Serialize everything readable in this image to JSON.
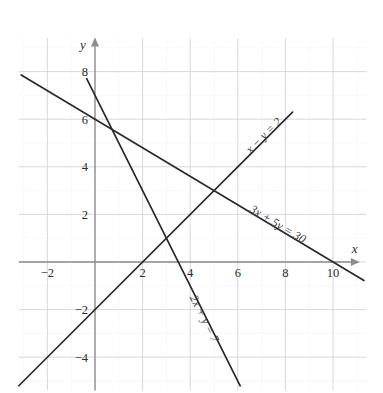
{
  "figure": {
    "type": "line-graph",
    "background": "#ffffff",
    "line_color": "#2a2a2a",
    "axis_color": "#8c8c8c",
    "grid_color_minor": "#e4e4ea",
    "grid_color_major": "#d2d2da"
  },
  "axes": {
    "x_label": "x",
    "y_label": "y",
    "x_ticks": [
      "-2",
      "2",
      "4",
      "6",
      "8",
      "10"
    ],
    "y_ticks": [
      "8",
      "6",
      "4",
      "2",
      "-2",
      "-4"
    ],
    "x_range": [
      -3.2,
      11.4
    ],
    "y_range": [
      -5.4,
      9.4
    ],
    "origin_px": [
      95,
      262
    ],
    "unit_px": 23.8,
    "grid": true,
    "arrow_x": true,
    "arrow_y": true
  },
  "chart_data": {
    "type": "line",
    "title": "",
    "xlabel": "x",
    "ylabel": "y",
    "xlim": [
      -3.2,
      11.4
    ],
    "ylim": [
      -5.4,
      9.4
    ],
    "grid": true,
    "legend": "inline-labels",
    "series": [
      {
        "name": "x - y = 2",
        "label": "x − y = 2",
        "equation": {
          "a": 1,
          "b": -1,
          "c": 2
        },
        "slope": 1,
        "intercept": -2,
        "x_intercept": 2,
        "y_intercept": -2,
        "draw_from": [
          -3.2,
          -5.2
        ],
        "draw_to": [
          8.3,
          6.3
        ],
        "label_at": [
          7.2,
          5.2
        ]
      },
      {
        "name": "3x + 5y = 30",
        "label": "3x + 5y = 30",
        "equation": {
          "a": 3,
          "b": 5,
          "c": 30
        },
        "slope": -0.6,
        "intercept": 6,
        "x_intercept": 10,
        "y_intercept": 6,
        "draw_from": [
          -3.1,
          7.86
        ],
        "draw_to": [
          11.3,
          -0.78
        ],
        "label_at": [
          7.6,
          1.45
        ]
      },
      {
        "name": "2x + y = 7",
        "label": "2x + y = 7",
        "equation": {
          "a": 2,
          "b": 1,
          "c": 7
        },
        "slope": -2,
        "intercept": 7,
        "x_intercept": 3.5,
        "y_intercept": 7,
        "draw_from": [
          -0.35,
          7.7
        ],
        "draw_to": [
          6.1,
          -5.2
        ],
        "label_at": [
          4.45,
          -2.45
        ]
      }
    ],
    "intersections": [
      {
        "point": [
          5,
          3
        ],
        "lines": [
          "x - y = 2",
          "3x + 5y = 30"
        ]
      },
      {
        "point": [
          3,
          1
        ],
        "lines": [
          "x - y = 2",
          "2x + y = 7"
        ]
      },
      {
        "point": [
          1,
          5
        ],
        "lines": [
          "2x + y = 7",
          "3x + 5y = 30"
        ]
      }
    ]
  }
}
